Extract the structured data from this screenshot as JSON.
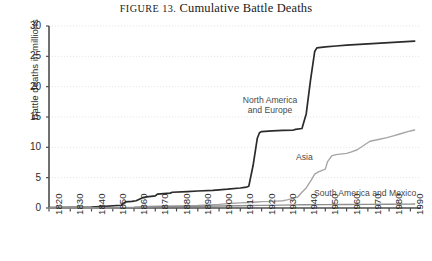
{
  "title": {
    "lead": "FIGURE 13.",
    "main": "Cumulative Battle Deaths"
  },
  "axes": {
    "ylabel": "Battle deaths in millions",
    "yticks": [
      "0",
      "5",
      "10",
      "15",
      "20",
      "25",
      "30"
    ],
    "xticks": [
      "1820",
      "1830",
      "1840",
      "1850",
      "1860",
      "1870",
      "1880",
      "1890",
      "1900",
      "1910",
      "1920",
      "1930",
      "1940",
      "1950",
      "1960",
      "1970",
      "1980",
      "1990"
    ]
  },
  "series_labels": {
    "north_america_europe": "North America and Europe",
    "north_america_europe_line1": "North America",
    "north_america_europe_line2": "and Europe",
    "asia": "Asia",
    "south_america_mexico": "South America and Mexico"
  },
  "colors": {
    "north_america_europe": "#2b2b2b",
    "asia": "#a6a6a6",
    "south_america_mexico": "#8f8f8f",
    "axis": "#4d4d4d",
    "grid": "#e6e6e6",
    "text": "#2b2b2b"
  },
  "chart_data": {
    "type": "line",
    "title": "FIGURE 13. Cumulative Battle Deaths",
    "xlabel": "",
    "ylabel": "Battle deaths in millions",
    "xlim": [
      1820,
      1995
    ],
    "ylim": [
      0,
      30
    ],
    "grid": true,
    "legend": "inline-annotations",
    "series": [
      {
        "name": "North America and Europe",
        "color": "#2b2b2b",
        "x": [
          1820,
          1830,
          1840,
          1848,
          1854,
          1856,
          1859,
          1861,
          1864,
          1866,
          1870,
          1871,
          1877,
          1878,
          1885,
          1890,
          1897,
          1900,
          1904,
          1910,
          1912,
          1913,
          1914,
          1916,
          1918,
          1919,
          1920,
          1925,
          1930,
          1935,
          1936,
          1939,
          1941,
          1943,
          1945,
          1946,
          1950,
          1955,
          1960,
          1970,
          1980,
          1990,
          1992
        ],
        "values": [
          0.05,
          0.1,
          0.15,
          0.3,
          0.45,
          1.0,
          1.1,
          1.2,
          1.7,
          1.85,
          2.0,
          2.3,
          2.45,
          2.6,
          2.7,
          2.8,
          2.9,
          3.0,
          3.1,
          3.3,
          3.4,
          3.45,
          3.6,
          7.0,
          11.5,
          12.4,
          12.6,
          12.7,
          12.8,
          12.85,
          12.95,
          13.1,
          15.5,
          21.0,
          25.8,
          26.4,
          26.55,
          26.7,
          26.85,
          27.05,
          27.25,
          27.45,
          27.5
        ]
      },
      {
        "name": "Asia",
        "color": "#a6a6a6",
        "x": [
          1820,
          1840,
          1850,
          1860,
          1865,
          1870,
          1880,
          1890,
          1895,
          1900,
          1905,
          1910,
          1914,
          1918,
          1920,
          1925,
          1930,
          1932,
          1937,
          1939,
          1941,
          1943,
          1945,
          1947,
          1950,
          1951,
          1953,
          1955,
          1960,
          1962,
          1965,
          1968,
          1971,
          1975,
          1979,
          1982,
          1985,
          1990,
          1992
        ],
        "values": [
          0.02,
          0.05,
          0.08,
          0.15,
          0.25,
          0.3,
          0.35,
          0.4,
          0.5,
          0.6,
          0.75,
          0.85,
          0.9,
          1.0,
          1.05,
          1.1,
          1.2,
          1.35,
          1.8,
          2.6,
          3.3,
          4.4,
          5.6,
          6.0,
          6.4,
          7.6,
          8.6,
          8.8,
          9.0,
          9.2,
          9.6,
          10.3,
          11.0,
          11.3,
          11.6,
          11.9,
          12.2,
          12.7,
          12.85
        ]
      },
      {
        "name": "South America and Mexico",
        "color": "#8f8f8f",
        "x": [
          1820,
          1830,
          1840,
          1850,
          1860,
          1865,
          1870,
          1880,
          1890,
          1900,
          1910,
          1915,
          1920,
          1930,
          1935,
          1940,
          1950,
          1960,
          1970,
          1980,
          1990,
          1992
        ],
        "values": [
          0.01,
          0.02,
          0.03,
          0.05,
          0.08,
          0.15,
          0.22,
          0.26,
          0.3,
          0.33,
          0.36,
          0.4,
          0.43,
          0.47,
          0.52,
          0.54,
          0.56,
          0.58,
          0.6,
          0.62,
          0.64,
          0.65
        ]
      }
    ]
  }
}
